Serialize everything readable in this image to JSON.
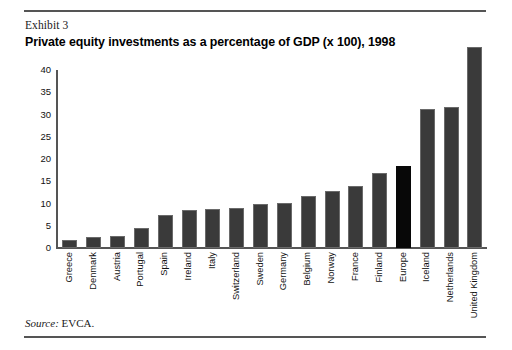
{
  "exhibit": {
    "label": "Exhibit 3",
    "title": "Private equity investments as a percentage of GDP (x 100), 1998"
  },
  "source": {
    "prefix": "Source:",
    "value": "EVCA."
  },
  "colors": {
    "bar": "#3a3a3a",
    "bar_highlight": "#080808",
    "axis": "#555555",
    "text": "#111111",
    "background": "#ffffff"
  },
  "chart_data": {
    "type": "bar",
    "title": "Private equity investments as a percentage of GDP (x 100), 1998",
    "subtitle": "Exhibit 3",
    "xlabel": "",
    "ylabel": "",
    "ylim": [
      0,
      40
    ],
    "yticks": [
      0,
      5,
      10,
      15,
      20,
      25,
      30,
      35,
      40
    ],
    "grid": false,
    "legend": null,
    "categories": [
      "Greece",
      "Denmark",
      "Austria",
      "Portugal",
      "Spain",
      "Ireland",
      "Italy",
      "Switzerland",
      "Sweden",
      "Germany",
      "Belgium",
      "Norway",
      "France",
      "Finland",
      "Europe",
      "Iceland",
      "Netherlands",
      "United Kingdom"
    ],
    "values": [
      1.8,
      2.5,
      2.6,
      4.5,
      7.5,
      8.6,
      8.8,
      9.1,
      9.9,
      10.2,
      11.7,
      12.9,
      14.0,
      16.8,
      18.5,
      31.2,
      31.6,
      50.0
    ],
    "highlight_category": "Europe",
    "bars": [
      {
        "category": "Greece",
        "value": 1.8,
        "highlight": false
      },
      {
        "category": "Denmark",
        "value": 2.5,
        "highlight": false
      },
      {
        "category": "Austria",
        "value": 2.6,
        "highlight": false
      },
      {
        "category": "Portugal",
        "value": 4.5,
        "highlight": false
      },
      {
        "category": "Spain",
        "value": 7.5,
        "highlight": false
      },
      {
        "category": "Ireland",
        "value": 8.6,
        "highlight": false
      },
      {
        "category": "Italy",
        "value": 8.8,
        "highlight": false
      },
      {
        "category": "Switzerland",
        "value": 9.1,
        "highlight": false
      },
      {
        "category": "Sweden",
        "value": 9.9,
        "highlight": false
      },
      {
        "category": "Germany",
        "value": 10.2,
        "highlight": false
      },
      {
        "category": "Belgium",
        "value": 11.7,
        "highlight": false
      },
      {
        "category": "Norway",
        "value": 12.9,
        "highlight": false
      },
      {
        "category": "France",
        "value": 14.0,
        "highlight": false
      },
      {
        "category": "Finland",
        "value": 16.8,
        "highlight": false
      },
      {
        "category": "Europe",
        "value": 18.5,
        "highlight": true
      },
      {
        "category": "Iceland",
        "value": 31.2,
        "highlight": false
      },
      {
        "category": "Netherlands",
        "value": 31.6,
        "highlight": false
      },
      {
        "category": "United Kingdom",
        "value": 50.0,
        "highlight": false
      }
    ]
  }
}
